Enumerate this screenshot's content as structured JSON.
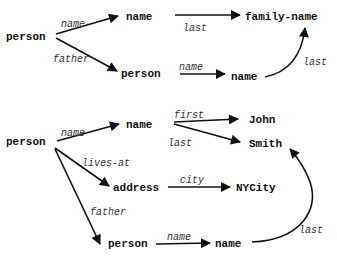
{
  "diagram": {
    "type": "semantic-network / object-graph",
    "graphs": [
      {
        "id": "top",
        "nodes": {
          "n1": {
            "label": "person"
          },
          "n2": {
            "label": "name"
          },
          "n3": {
            "label": "family-name"
          },
          "n4": {
            "label": "person"
          },
          "n5": {
            "label": "name"
          }
        },
        "edges": {
          "e1": {
            "from": "person",
            "to": "name",
            "label": "name"
          },
          "e2": {
            "from": "person",
            "to": "person",
            "label": "father"
          },
          "e3": {
            "from": "name",
            "to": "family-name",
            "label": "last"
          },
          "e4": {
            "from": "person",
            "to": "name",
            "label": "name"
          },
          "e5": {
            "from": "name",
            "to": "family-name",
            "label": "last"
          }
        }
      },
      {
        "id": "bottom",
        "nodes": {
          "n1": {
            "label": "person"
          },
          "n2": {
            "label": "name"
          },
          "n3": {
            "label": "John"
          },
          "n4": {
            "label": "Smith"
          },
          "n5": {
            "label": "address"
          },
          "n6": {
            "label": "NYCity"
          },
          "n7": {
            "label": "person"
          },
          "n8": {
            "label": "name"
          }
        },
        "edges": {
          "e1": {
            "from": "person",
            "to": "name",
            "label": "name"
          },
          "e2": {
            "from": "name",
            "to": "John",
            "label": "first"
          },
          "e3": {
            "from": "name",
            "to": "Smith",
            "label": "last"
          },
          "e4": {
            "from": "person",
            "to": "address",
            "label": "lives-at"
          },
          "e5": {
            "from": "address",
            "to": "NYCity",
            "label": "city"
          },
          "e6": {
            "from": "person",
            "to": "person",
            "label": "father"
          },
          "e7": {
            "from": "person",
            "to": "name",
            "label": "name"
          },
          "e8": {
            "from": "name",
            "to": "Smith",
            "label": "last"
          }
        }
      }
    ]
  }
}
